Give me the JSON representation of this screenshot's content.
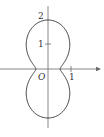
{
  "chart_data": {
    "type": "line",
    "title": "",
    "polar": {
      "a": 0.5,
      "b": 1.5
    },
    "origin_label": "O",
    "x_ticks": [
      {
        "value": 1,
        "label": "1"
      }
    ],
    "y_ticks": [
      {
        "value": 1,
        "label": "1"
      },
      {
        "value": 2,
        "label": "2"
      }
    ],
    "xlim": [
      -2,
      2.2
    ],
    "ylim": [
      -2.6,
      2.6
    ],
    "key_points": [
      {
        "x": 0,
        "y": 2
      },
      {
        "x": 0,
        "y": -2
      },
      {
        "x": 0.5,
        "y": 0
      },
      {
        "x": -0.5,
        "y": 0
      }
    ],
    "grid": false,
    "legend": null
  },
  "colors": {
    "axis": "#6a6a6a",
    "curve": "#3a3a3a",
    "text": "#333333"
  }
}
